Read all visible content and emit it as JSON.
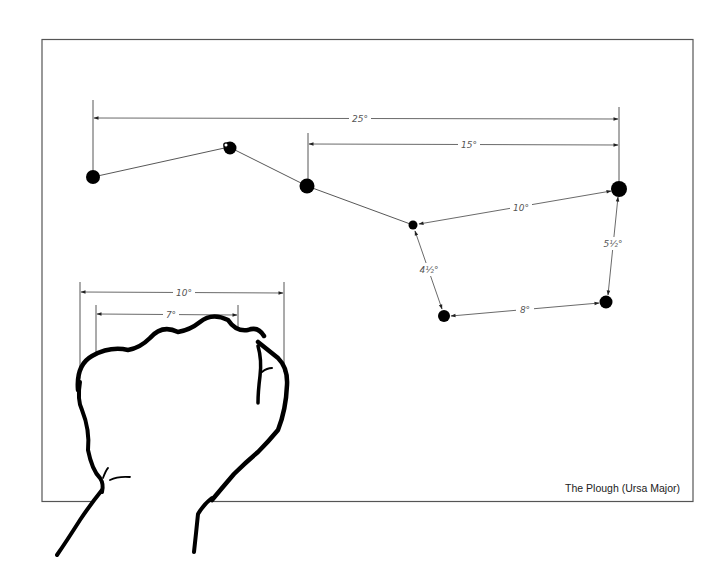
{
  "caption": "The Plough (Ursa Major)",
  "colors": {
    "background": "#ffffff",
    "ink": "#000000",
    "frame": "#555555",
    "dimension_lines": "#444444",
    "labels": "#555555"
  },
  "stars": [
    {
      "id": "alkaid",
      "x": 93,
      "y": 177,
      "r": 7
    },
    {
      "id": "mizar",
      "x": 229,
      "y": 147,
      "r": 7,
      "has_companion": true
    },
    {
      "id": "alioth",
      "x": 307,
      "y": 186,
      "r": 7.5
    },
    {
      "id": "megrez",
      "x": 413,
      "y": 225,
      "r": 4.5
    },
    {
      "id": "dubhe",
      "x": 619,
      "y": 189,
      "r": 8
    },
    {
      "id": "merak",
      "x": 606,
      "y": 302,
      "r": 6.5
    },
    {
      "id": "phecda",
      "x": 444,
      "y": 316,
      "r": 6
    }
  ],
  "measurements": {
    "alkaid_to_dubhe": "25°",
    "alioth_to_dubhe": "15°",
    "megrez_to_dubhe": "10°",
    "merak_to_dubhe": "5½°",
    "megrez_to_phecda": "4½°",
    "phecda_to_merak": "8°",
    "fist_width_outer": "10°",
    "fist_width_knuckles": "7°"
  },
  "illustration": {
    "subject": "clenched fist held at arm's length",
    "purpose": "angular distance estimation"
  }
}
